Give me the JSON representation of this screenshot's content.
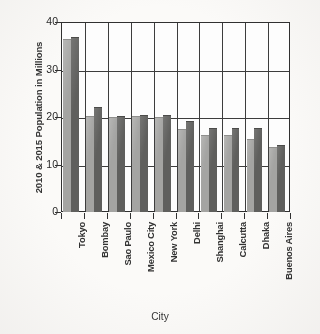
{
  "chart_data": {
    "type": "bar",
    "title": "",
    "xlabel": "City",
    "ylabel": "2010 & 2015 Population in Millions",
    "ylim": [
      0,
      40
    ],
    "yticks": [
      0,
      10,
      20,
      30,
      40
    ],
    "grid": true,
    "legend": "none",
    "categories": [
      "Tokyo",
      "Bombay",
      "Sao Paulo",
      "Mexico City",
      "New York",
      "Delhi",
      "Shanghai",
      "Calcutta",
      "Dhaka",
      "Buenos Aires"
    ],
    "series": [
      {
        "name": "2010",
        "color": "#a3a3a1",
        "values": [
          36.2,
          20.0,
          19.8,
          20.0,
          19.7,
          17.2,
          16.0,
          15.9,
          15.2,
          13.4
        ]
      },
      {
        "name": "2015",
        "color": "#5d5d5b",
        "values": [
          36.6,
          22.0,
          20.1,
          20.3,
          20.2,
          19.0,
          17.4,
          17.5,
          17.4,
          14.0
        ]
      }
    ]
  },
  "axis": {
    "y_title": "2010 & 2015 Population in Millions",
    "x_title": "City",
    "y_tick_labels": [
      "40",
      "30",
      "20",
      "10",
      "0"
    ]
  }
}
